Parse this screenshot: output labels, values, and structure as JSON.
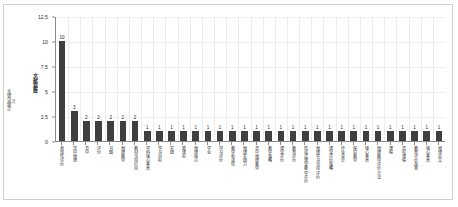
{
  "figure": {
    "outer_y_caption": "关键词频次",
    "outer_y_caption_sub": "（次）"
  },
  "chart_data": {
    "type": "bar",
    "title": "",
    "xlabel": "",
    "ylabel": "文献篇数",
    "ylim": [
      0,
      12.5
    ],
    "yticks": [
      0,
      2.5,
      5,
      7.5,
      10,
      12.5
    ],
    "ytick_labels": [
      "0",
      "2.5",
      "5",
      "7.5",
      "10",
      "12.5"
    ],
    "grid": true,
    "legend": null,
    "bar_color": "#3f3f3f",
    "show_value_labels": true,
    "categories": [
      "表现性评价",
      "高中地理",
      "高中",
      "评价",
      "习题",
      "地理教学",
      "教材活动栏目",
      "学科核心素养",
      "学习目标",
      "实践",
      "新课标",
      "地理核心",
      "学业",
      "学习评价",
      "教学有效性",
      "地理实践力",
      "高中地理教学",
      "教学策略",
      "课堂评价",
      "教育评价",
      "形成式课堂教学评价",
      "地理学习活动评价",
      "课堂评价策略",
      "作业设计",
      "探究教学",
      "核心素养",
      "地理教学评价方法",
      "课程",
      "高校课程",
      "教育评价改革",
      "核心素养",
      "地理论文"
    ],
    "values": [
      10,
      3,
      2,
      2,
      2,
      2,
      2,
      1,
      1,
      1,
      1,
      1,
      1,
      1,
      1,
      1,
      1,
      1,
      1,
      1,
      1,
      1,
      1,
      1,
      1,
      1,
      1,
      1,
      1,
      1,
      1,
      1
    ],
    "value_labels": [
      "10",
      "3",
      "2",
      "2",
      "2",
      "2",
      "2",
      "1",
      "1",
      "1",
      "1",
      "1",
      "1",
      "1",
      "1",
      "1",
      "1",
      "1",
      "1",
      "1",
      "1",
      "1",
      "1",
      "1",
      "1",
      "1",
      "1",
      "1",
      "1",
      "1",
      "1",
      "1"
    ]
  }
}
